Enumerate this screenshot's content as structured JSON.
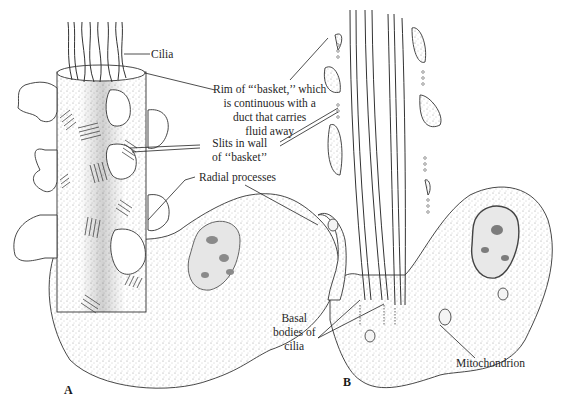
{
  "figure": {
    "panels": [
      {
        "id": "A",
        "label": "A"
      },
      {
        "id": "B",
        "label": "B"
      }
    ],
    "labels": {
      "cilia": "Cilia",
      "rim": [
        "Rim of “‘basket,’’ which",
        "is continuous with a",
        "duct that carries",
        "fluid away"
      ],
      "slits": [
        "Slits in wall",
        "of ‘‘basket’’"
      ],
      "radial": "Radial processes",
      "basal": [
        "Basal",
        "bodies of",
        "cilia"
      ],
      "mito": "Mitochondrion"
    },
    "colors": {
      "ink": "#2a2a2a",
      "stipple": "#9a9a9a",
      "background": "#ffffff"
    }
  }
}
